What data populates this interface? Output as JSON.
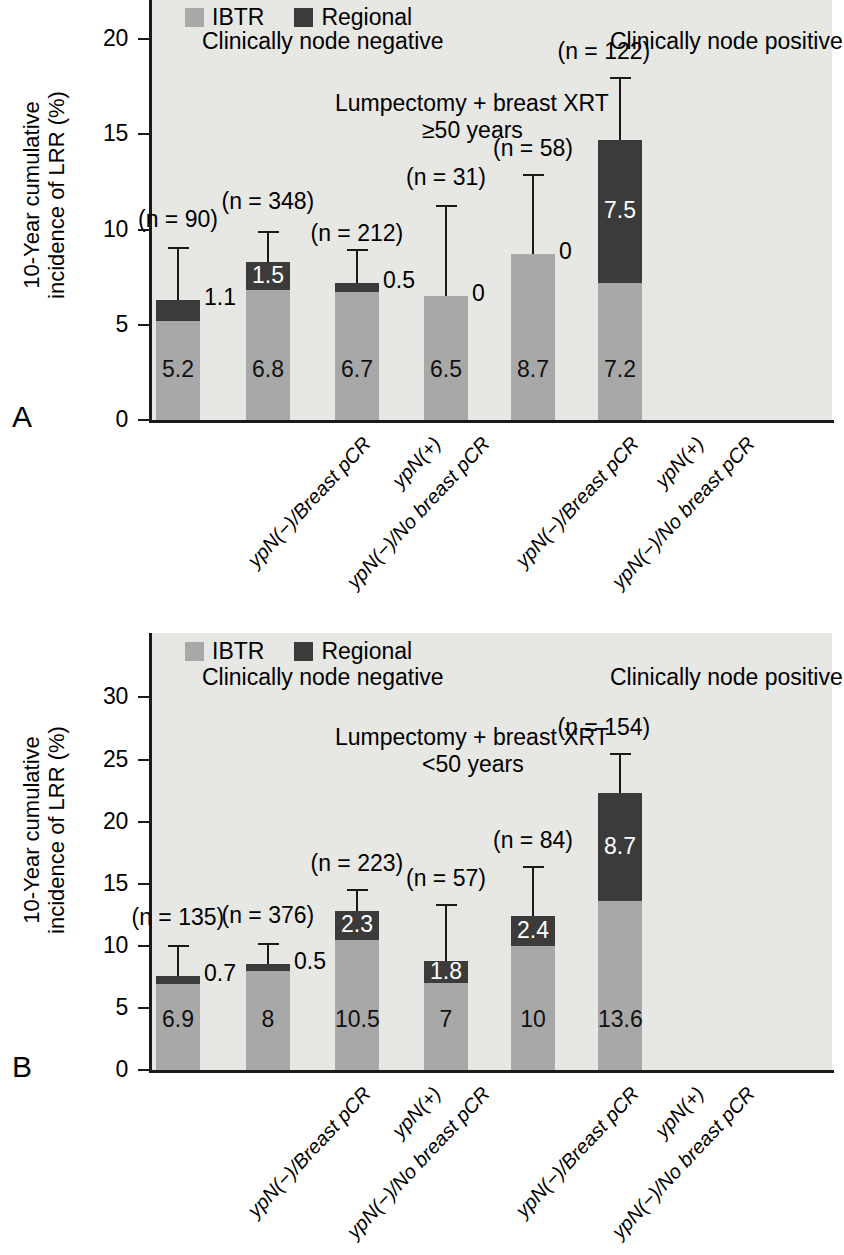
{
  "figure": {
    "panels": [
      {
        "letter": "A",
        "ylabel": "10-Year cumulative\nincidence of LRR (%)",
        "ylabel_line1": "10-Year cumulative",
        "ylabel_line2": "incidence of LRR (%)",
        "group_left": "Clinically node negative",
        "group_right": "Clinically node positive",
        "subtitle_line1": "Lumpectomy + breast XRT",
        "subtitle_line2": "≥50 years",
        "legend": [
          {
            "label": "IBTR",
            "color": "#a8a8a8"
          },
          {
            "label": "Regional",
            "color": "#3b3b3b"
          }
        ],
        "yticks": [
          "0",
          "5",
          "10",
          "15",
          "20"
        ]
      },
      {
        "letter": "B",
        "ylabel_line1": "10-Year cumulative",
        "ylabel_line2": "incidence of LRR (%)",
        "group_left": "Clinically node negative",
        "group_right": "Clinically node positive",
        "subtitle_line1": "Lumpectomy + breast XRT",
        "subtitle_line2": "<50 years",
        "legend": [
          {
            "label": "IBTR",
            "color": "#a8a8a8"
          },
          {
            "label": "Regional",
            "color": "#3b3b3b"
          }
        ],
        "yticks": [
          "0",
          "5",
          "10",
          "15",
          "20",
          "25",
          "30"
        ]
      }
    ]
  },
  "chart_data": [
    {
      "type": "bar",
      "panel": "A",
      "title": "Lumpectomy + breast XRT ≥50 years",
      "xlabel": "",
      "ylabel": "10-Year cumulative incidence of LRR (%)",
      "ylim": [
        0,
        21.5
      ],
      "ytick_values": [
        0,
        5,
        10,
        15,
        20
      ],
      "grid": false,
      "stacked": true,
      "legend": [
        "IBTR",
        "Regional"
      ],
      "legend_position": "top-left",
      "group_annotations": [
        "Clinically node negative",
        "Clinically node positive"
      ],
      "categories": [
        "ypN(−)/Breast pCR",
        "ypN(−)/No breast pCR",
        "ypN(+)",
        "ypN(−)/Breast pCR",
        "ypN(−)/No breast pCR",
        "ypN(+)"
      ],
      "series": [
        {
          "name": "IBTR",
          "color": "#a8a8a8",
          "values": [
            5.2,
            6.8,
            6.7,
            6.5,
            8.7,
            7.2
          ],
          "labels": [
            "5.2",
            "6.8",
            "6.7",
            "6.5",
            "8.7",
            "7.2"
          ]
        },
        {
          "name": "Regional",
          "color": "#3b3b3b",
          "values": [
            1.1,
            1.5,
            0.5,
            0,
            0,
            7.5
          ],
          "labels": [
            "1.1",
            "1.5",
            "0.5",
            "0",
            "0",
            "7.5"
          ]
        }
      ],
      "totals": [
        6.3,
        8.3,
        7.2,
        6.5,
        8.7,
        14.7
      ],
      "error_upper": [
        9.1,
        9.9,
        9.0,
        11.3,
        12.9,
        18.0
      ],
      "n_labels": [
        "(n = 90)",
        "(n = 348)",
        "(n = 212)",
        "(n = 31)",
        "(n = 58)",
        "(n = 122)"
      ],
      "n_values": [
        90,
        348,
        212,
        31,
        58,
        122
      ]
    },
    {
      "type": "bar",
      "panel": "B",
      "title": "Lumpectomy + breast XRT <50 years",
      "xlabel": "",
      "ylabel": "10-Year cumulative incidence of LRR (%)",
      "ylim": [
        0,
        33.5
      ],
      "ytick_values": [
        0,
        5,
        10,
        15,
        20,
        25,
        30
      ],
      "grid": false,
      "stacked": true,
      "legend": [
        "IBTR",
        "Regional"
      ],
      "legend_position": "top-left",
      "group_annotations": [
        "Clinically node negative",
        "Clinically node positive"
      ],
      "categories": [
        "ypN(−)/Breast pCR",
        "ypN(−)/No breast pCR",
        "ypN(+)",
        "ypN(−)/Breast pCR",
        "ypN(−)/No breast pCR",
        "ypN(+)"
      ],
      "series": [
        {
          "name": "IBTR",
          "color": "#a8a8a8",
          "values": [
            6.9,
            8,
            10.5,
            7,
            10,
            13.6
          ],
          "labels": [
            "6.9",
            "8",
            "10.5",
            "7",
            "10",
            "13.6"
          ]
        },
        {
          "name": "Regional",
          "color": "#3b3b3b",
          "values": [
            0.7,
            0.5,
            2.3,
            1.8,
            2.4,
            8.7
          ],
          "labels": [
            "0.7",
            "0.5",
            "2.3",
            "1.8",
            "2.4",
            "8.7"
          ]
        }
      ],
      "totals": [
        7.6,
        8.5,
        12.8,
        8.8,
        12.4,
        22.3
      ],
      "error_upper": [
        10.1,
        10.2,
        14.6,
        13.4,
        16.4,
        25.5
      ],
      "n_labels": [
        "(n = 135)",
        "(n = 376)",
        "(n = 223)",
        "(n = 57)",
        "(n = 84)",
        "(n = 154)"
      ],
      "n_values": [
        135,
        376,
        223,
        57,
        84,
        154
      ]
    }
  ]
}
